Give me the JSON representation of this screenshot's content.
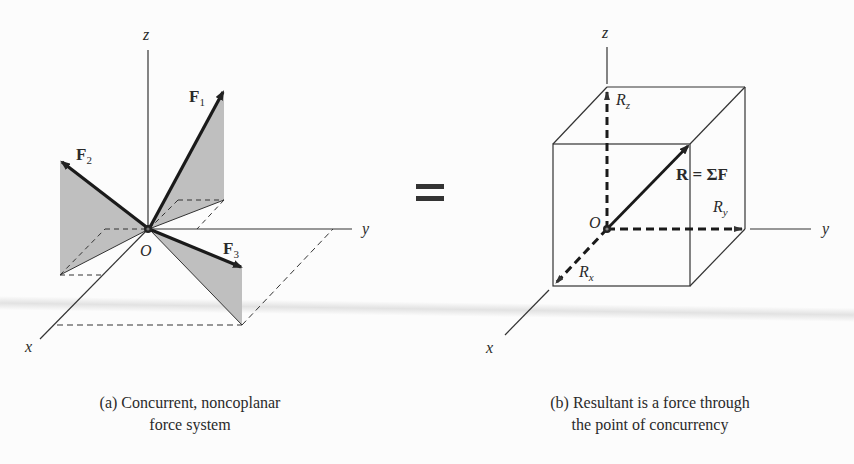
{
  "figure_a": {
    "axis_labels": {
      "z": "z",
      "y": "y",
      "x": "x"
    },
    "origin_label": "O",
    "forces": [
      {
        "name": "F",
        "subscript": "1"
      },
      {
        "name": "F",
        "subscript": "2"
      },
      {
        "name": "F",
        "subscript": "3"
      }
    ],
    "caption_line1": "(a) Concurrent, noncoplanar",
    "caption_line2": "force system"
  },
  "equals_symbol": "=",
  "figure_b": {
    "axis_labels": {
      "z": "z",
      "y": "y",
      "x": "x"
    },
    "origin_label": "O",
    "resultant_label": "R = ΣF",
    "components": [
      {
        "name": "R",
        "subscript": "z"
      },
      {
        "name": "R",
        "subscript": "y"
      },
      {
        "name": "R",
        "subscript": "x"
      }
    ],
    "caption_line1": "(b) Resultant is a force through",
    "caption_line2": "the point of concurrency"
  },
  "colors": {
    "line": "#2b2b2b",
    "shade": "#bdbdbd",
    "background": "#fcfcfc"
  }
}
